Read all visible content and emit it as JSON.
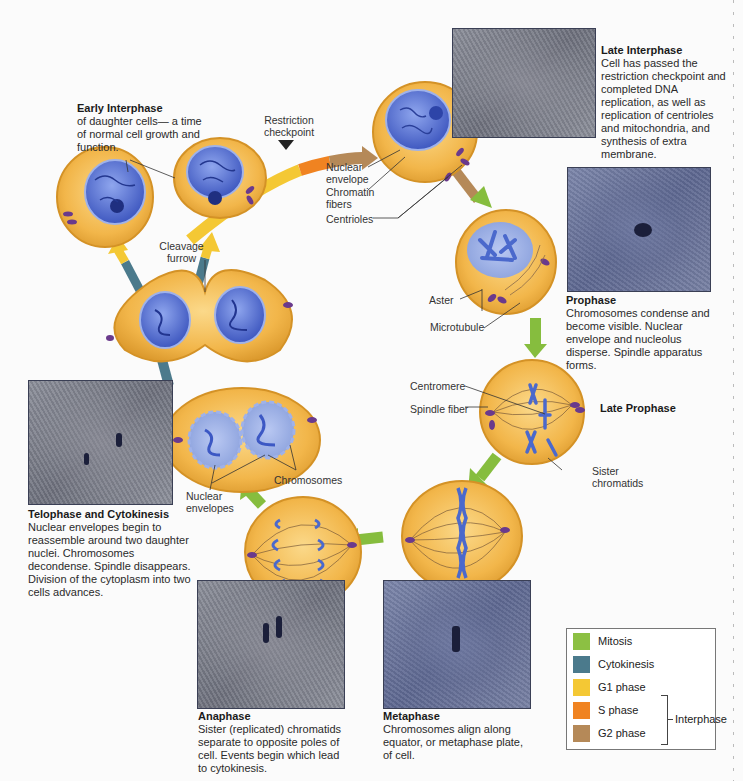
{
  "captions": {
    "early_interphase": {
      "title": "Early Interphase",
      "body": "of daughter cells— a time of normal cell growth and function."
    },
    "late_interphase": {
      "title": "Late Interphase",
      "body": "Cell has passed the restriction checkpoint and completed DNA replication, as well as replication of centrioles and mitochondria, and synthesis of extra membrane."
    },
    "prophase": {
      "title": "Prophase",
      "body": "Chromosomes condense and become visible. Nuclear envelope and nucleolus disperse. Spindle apparatus forms."
    },
    "late_prophase": {
      "title": "Late Prophase"
    },
    "telophase": {
      "title": "Telophase and Cytokinesis",
      "body": "Nuclear envelopes begin to reassemble around two daughter nuclei. Chromosomes decondense. Spindle disappears. Division of the cytoplasm into two cells advances."
    },
    "anaphase": {
      "title": "Anaphase",
      "body": "Sister (replicated) chromatids separate to opposite poles of cell. Events begin which lead to cytokinesis."
    },
    "metaphase": {
      "title": "Metaphase",
      "body": "Chromosomes align along equator, or metaphase plate, of cell."
    }
  },
  "labels": {
    "restriction_checkpoint": "Restriction checkpoint",
    "nuclear_envelope": "Nuclear envelope",
    "chromatin_fibers": "Chromatin fibers",
    "centrioles": "Centrioles",
    "cleavage_furrow": "Cleavage furrow",
    "aster": "Aster",
    "microtubule": "Microtubule",
    "centromere": "Centromere",
    "spindle_fiber": "Spindle fiber",
    "sister_chromatids": "Sister chromatids",
    "chromosomes": "Chromosomes",
    "nuclear_envelopes": "Nuclear envelopes"
  },
  "legend": {
    "items": [
      {
        "label": "Mitosis",
        "color": "#8cc043"
      },
      {
        "label": "Cytokinesis",
        "color": "#4b7a8c"
      },
      {
        "label": "G1 phase",
        "color": "#f4c834"
      },
      {
        "label": "S phase",
        "color": "#f08321"
      },
      {
        "label": "G2 phase",
        "color": "#b58958"
      }
    ],
    "group_label": "Interphase"
  },
  "colors": {
    "cell_fill": "#f2b64a",
    "cell_border": "#d7962b",
    "nucleus": "#5a74d0",
    "mitosis_arrow": "#86bd3e",
    "cytokinesis_arrow": "#4b7a8c",
    "g1_arrow": "#f4c834",
    "s_arrow": "#f08321",
    "g2_arrow": "#b58958"
  }
}
